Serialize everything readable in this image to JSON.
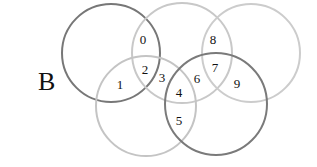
{
  "figure_label": "B",
  "circles": [
    {
      "id": "top-left",
      "cx": 111,
      "cy": 53,
      "r": 49,
      "stroke": "#777777",
      "width": 2
    },
    {
      "id": "top-middle",
      "cx": 182,
      "cy": 53,
      "r": 50,
      "stroke": "#c8c8c8",
      "width": 2
    },
    {
      "id": "top-right",
      "cx": 251,
      "cy": 53,
      "r": 49,
      "stroke": "#cccccc",
      "width": 2
    },
    {
      "id": "bottom-left",
      "cx": 146,
      "cy": 106,
      "r": 50,
      "stroke": "#c4c4c4",
      "width": 2
    },
    {
      "id": "bottom-right",
      "cx": 216,
      "cy": 104,
      "r": 51,
      "stroke": "#7a7a7a",
      "width": 2
    }
  ],
  "regions": [
    {
      "label": "0",
      "x": 143,
      "y": 44
    },
    {
      "label": "1",
      "x": 120,
      "y": 89
    },
    {
      "label": "2",
      "x": 145,
      "y": 74
    },
    {
      "label": "3",
      "x": 162,
      "y": 82
    },
    {
      "label": "4",
      "x": 179,
      "y": 97
    },
    {
      "label": "5",
      "x": 179,
      "y": 125
    },
    {
      "label": "6",
      "x": 197,
      "y": 83
    },
    {
      "label": "7",
      "x": 215,
      "y": 72
    },
    {
      "label": "8",
      "x": 213,
      "y": 44
    },
    {
      "label": "9",
      "x": 237,
      "y": 88
    }
  ]
}
